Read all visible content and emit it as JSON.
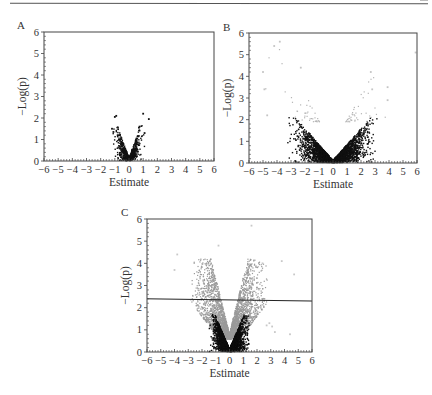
{
  "figure": {
    "panels": [
      "A",
      "B",
      "C"
    ]
  },
  "chart_data": [
    {
      "type": "scatter",
      "panel": "A",
      "title": "",
      "xlabel": "Estimate",
      "ylabel": "−Log(p)",
      "xlim": [
        -6,
        6
      ],
      "ylim": [
        0,
        6
      ],
      "xticks": [
        "−6",
        "−5",
        "−4",
        "−3",
        "−2",
        "−1",
        "0",
        "1",
        "2",
        "3",
        "4",
        "5",
        "6"
      ],
      "yticks": [
        "0",
        "1",
        "2",
        "3",
        "4",
        "5",
        "6"
      ],
      "grid": false,
      "threshold_line": null,
      "series": [
        {
          "name": "significant-dark",
          "color": "#111111",
          "count": 700,
          "x_spread": 1.2,
          "slope": 1.9,
          "max_y": 1.7
        },
        {
          "name": "outliers",
          "color": "#111111",
          "points": [
            [
              -1.0,
              2.05
            ],
            [
              -0.9,
              2.1
            ],
            [
              1.0,
              2.2
            ],
            [
              1.4,
              1.95
            ],
            [
              -1.2,
              1.5
            ],
            [
              0.7,
              1.55
            ],
            [
              0.75,
              1.6
            ],
            [
              1.1,
              1.3
            ],
            [
              -1.1,
              1.35
            ],
            [
              -0.8,
              1.2
            ]
          ]
        }
      ],
      "frame": {
        "x": 44,
        "y": 32,
        "w": 170,
        "h": 129
      },
      "label_pos": {
        "x": 17,
        "y": 19
      }
    },
    {
      "type": "scatter",
      "panel": "B",
      "title": "",
      "xlabel": "Estimate",
      "ylabel": "−Log(p)",
      "xlim": [
        -6,
        6
      ],
      "ylim": [
        0,
        6
      ],
      "xticks": [
        "−6",
        "−5",
        "−4",
        "−3",
        "−2",
        "−1",
        "0",
        "1",
        "2",
        "3",
        "4",
        "5",
        "6"
      ],
      "yticks": [
        "0",
        "1",
        "2",
        "3",
        "4",
        "5",
        "6"
      ],
      "grid": false,
      "threshold_line": null,
      "series": [
        {
          "name": "dark",
          "color": "#111111",
          "count": 2600,
          "x_spread": 3.4,
          "slope": 0.75,
          "max_y": 2.1
        },
        {
          "name": "light",
          "color": "#b5b5b5",
          "count": 130,
          "x_spread": 5.5,
          "slope": 0.75,
          "min_y": 1.9,
          "max_y": 5.7
        },
        {
          "name": "outliers",
          "color": "#c4c4c4",
          "points": [
            [
              -4.2,
              5.4
            ],
            [
              -3.8,
              5.6
            ],
            [
              5.9,
              5.1
            ],
            [
              -5.0,
              4.2
            ],
            [
              2.7,
              4.2
            ],
            [
              -2.3,
              4.4
            ],
            [
              3.9,
              3.5
            ],
            [
              -4.9,
              3.4
            ],
            [
              2.8,
              3.4
            ],
            [
              3.9,
              2.9
            ],
            [
              -4.7,
              2.2
            ]
          ]
        }
      ],
      "frame": {
        "x": 249,
        "y": 33,
        "w": 168,
        "h": 130
      },
      "label_pos": {
        "x": 223,
        "y": 21
      }
    },
    {
      "type": "scatter",
      "panel": "C",
      "title": "",
      "xlabel": "Estimate",
      "ylabel": "−Log(p)",
      "xlim": [
        -6,
        6
      ],
      "ylim": [
        0,
        6
      ],
      "xticks": [
        "−6",
        "−5",
        "−4",
        "−3",
        "−2",
        "−1",
        "0",
        "1",
        "2",
        "3",
        "4",
        "5",
        "6"
      ],
      "yticks": [
        "0",
        "1",
        "2",
        "3",
        "4",
        "5",
        "6"
      ],
      "grid": false,
      "threshold_line": {
        "y_left": 2.4,
        "y_right": 2.3,
        "color": "#222222"
      },
      "series": [
        {
          "name": "light",
          "color": "#9a9a9a",
          "count": 3600,
          "x_spread": 3.0,
          "slope": 1.6,
          "min_y": 0.6,
          "max_y": 4.2
        },
        {
          "name": "dark",
          "color": "#0d0d0d",
          "count": 2600,
          "x_spread": 1.6,
          "slope": 1.5,
          "max_y": 1.7
        },
        {
          "name": "outliers",
          "color": "#c8c8c8",
          "points": [
            [
              1.6,
              5.7
            ],
            [
              -0.8,
              4.8
            ],
            [
              -3.8,
              4.4
            ],
            [
              2.4,
              4.0
            ],
            [
              3.8,
              4.1
            ],
            [
              4.7,
              3.5
            ],
            [
              -4.0,
              3.7
            ],
            [
              2.7,
              1.2
            ],
            [
              3.1,
              1.15
            ],
            [
              2.9,
              1.3
            ],
            [
              4.4,
              0.8
            ],
            [
              3.3,
              0.9
            ]
          ]
        }
      ],
      "frame": {
        "x": 147,
        "y": 219,
        "w": 165,
        "h": 133
      },
      "label_pos": {
        "x": 121,
        "y": 206
      }
    }
  ]
}
